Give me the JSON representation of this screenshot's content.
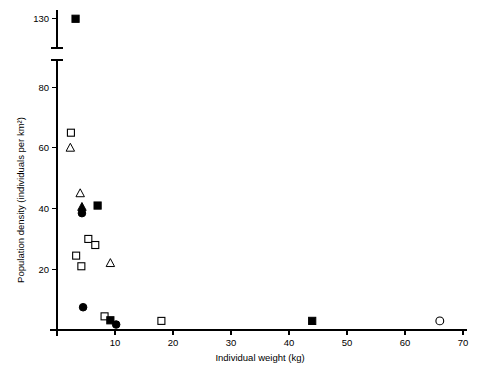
{
  "chart_data": {
    "type": "scatter",
    "title": "",
    "xlabel": "Individual weight (kg)",
    "ylabel": "Population density (individuals per km²)",
    "xlim": [
      0,
      70
    ],
    "ylim": [
      0,
      135
    ],
    "grid": false,
    "legend": "none",
    "axis_break": {
      "present": true,
      "lower_segment": [
        0,
        85
      ],
      "upper_segment": [
        120,
        133
      ]
    },
    "xticks": [
      0,
      10,
      20,
      30,
      40,
      50,
      60,
      70
    ],
    "xticklabels": [
      "",
      "10",
      "20",
      "30",
      "40",
      "50",
      "60",
      "70"
    ],
    "yticks": [
      20,
      40,
      60,
      80,
      130
    ],
    "yticklabels": [
      "20",
      "40",
      "60",
      "80",
      "130"
    ],
    "series": [
      {
        "name": "open-square",
        "marker": "open-square",
        "points": [
          {
            "x": 2.4,
            "y": 65.0
          },
          {
            "x": 5.4,
            "y": 30.0
          },
          {
            "x": 6.6,
            "y": 28.0
          },
          {
            "x": 3.3,
            "y": 24.5
          },
          {
            "x": 4.2,
            "y": 21.0
          },
          {
            "x": 8.2,
            "y": 4.5
          },
          {
            "x": 18.0,
            "y": 3.0
          }
        ]
      },
      {
        "name": "filled-square",
        "marker": "filled-square",
        "points": [
          {
            "x": 3.2,
            "y": 130.0
          },
          {
            "x": 7.0,
            "y": 41.0
          },
          {
            "x": 9.2,
            "y": 3.2
          },
          {
            "x": 44.0,
            "y": 3.0
          }
        ]
      },
      {
        "name": "open-triangle",
        "marker": "open-triangle",
        "points": [
          {
            "x": 2.3,
            "y": 60.0
          },
          {
            "x": 4.0,
            "y": 45.0
          },
          {
            "x": 9.2,
            "y": 22.0
          }
        ]
      },
      {
        "name": "filled-triangle",
        "marker": "filled-triangle",
        "points": [
          {
            "x": 4.3,
            "y": 40.5
          }
        ]
      },
      {
        "name": "filled-circle",
        "marker": "filled-circle",
        "points": [
          {
            "x": 4.3,
            "y": 38.5
          },
          {
            "x": 4.5,
            "y": 7.5
          },
          {
            "x": 10.2,
            "y": 1.8
          }
        ]
      },
      {
        "name": "open-circle",
        "marker": "open-circle",
        "points": [
          {
            "x": 66.0,
            "y": 3.0
          }
        ]
      }
    ]
  }
}
